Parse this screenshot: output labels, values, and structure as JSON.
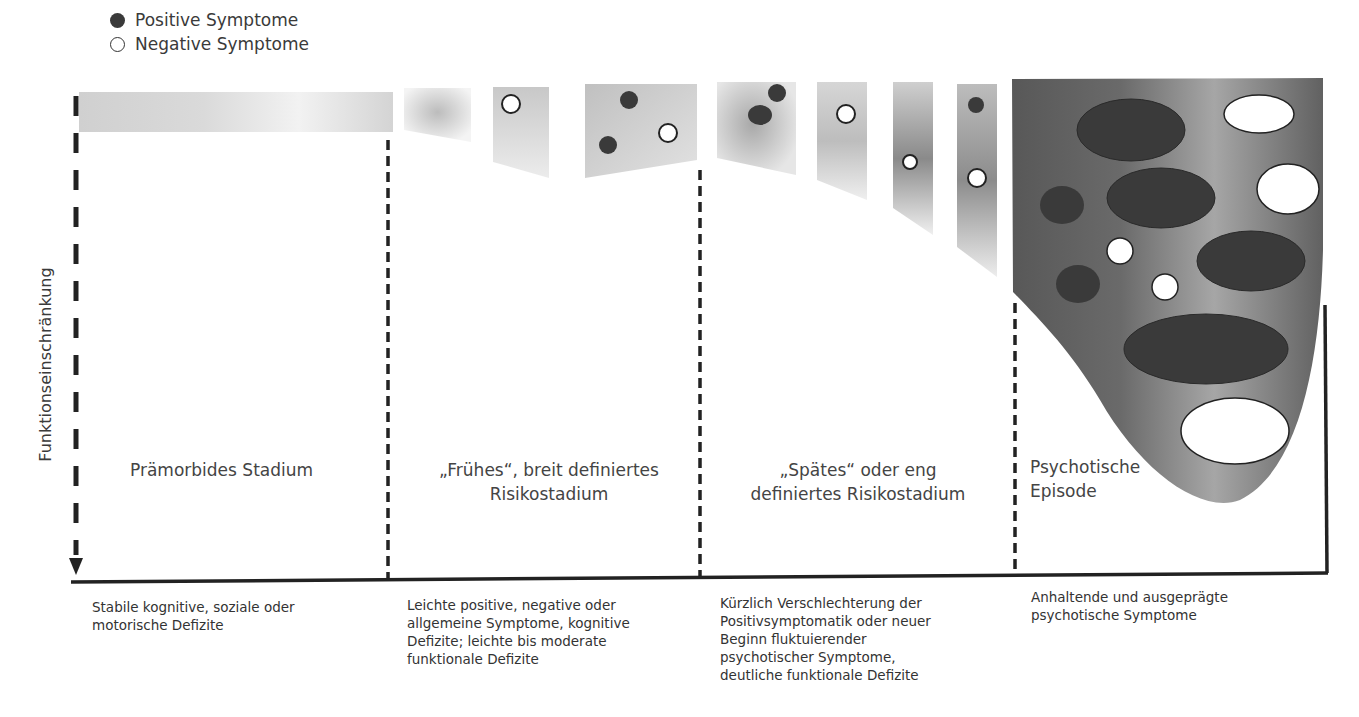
{
  "legend": {
    "items": [
      {
        "label": "Positive Symptome",
        "marker": "filled-dark-circle",
        "color": "#3a3a3a"
      },
      {
        "label": "Negative Symptome",
        "marker": "open-white-circle",
        "color": "#ffffff"
      }
    ]
  },
  "axis": {
    "y_label": "Funktionseinschränkung",
    "y_direction": "down (arrow)"
  },
  "stages": [
    {
      "title": "Prämorbides Stadium",
      "description": "Stabile kognitive, soziale oder motorische Defizite",
      "description_lines": [
        "Stabile kognitive, soziale oder",
        "motorische Defizite"
      ]
    },
    {
      "title": "„Frühes“, breit definiertes Risikostadium",
      "title_lines": [
        "„Frühes“, breit definiertes",
        "Risikostadium"
      ],
      "description": "Leichte positive, negative oder allgemeine Symptome, kognitive Defizite; leichte bis moderate funktionale Defizite",
      "description_lines": [
        "Leichte positive, negative oder",
        "allgemeine Symptome, kognitive",
        "Defizite; leichte bis moderate",
        "funktionale Defizite"
      ]
    },
    {
      "title": "„Spätes“ oder eng definiertes Risikostadium",
      "title_lines": [
        "„Spätes“ oder eng",
        "definiertes Risikostadium"
      ],
      "description": "Kürzlich Verschlechterung der Positivsymptomatik oder neuer Beginn fluktuierender psychotischer Symptome, deutliche funktionale Defizite",
      "description_lines": [
        "Kürzlich Verschlechterung der",
        "Positivsymptomatik oder neuer",
        "Beginn fluktuierender",
        "psychotischer Symptome,",
        "deutliche funktionale Defizite"
      ]
    },
    {
      "title": "Psychotische Episode",
      "title_lines": [
        "Psychotische",
        "Episode"
      ],
      "description": "Anhaltende und ausgeprägte psychotische Symptome",
      "description_lines": [
        "Anhaltende und ausgeprägte",
        "psychotische Symptome"
      ]
    }
  ],
  "colors": {
    "positive": "#3a3a3a",
    "negative": "#ffffff",
    "band_light": "#d8d8d8",
    "band_dark": "#6a6a6a",
    "axis": "#222222"
  }
}
